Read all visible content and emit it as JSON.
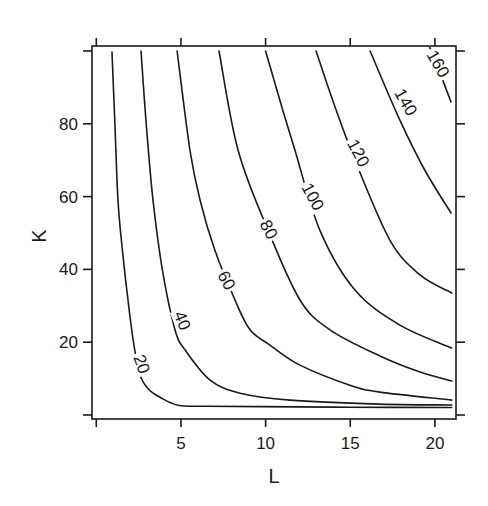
{
  "chart_data": {
    "type": "contour",
    "title": "",
    "xlabel": "L",
    "ylabel": "K",
    "xlim": [
      -0.25,
      21.25
    ],
    "ylim": [
      -1,
      101
    ],
    "x_ticks": [
      0,
      5,
      10,
      15,
      20
    ],
    "x_tick_labels": [
      "",
      "5",
      "10",
      "15",
      "20"
    ],
    "y_ticks": [
      0,
      20,
      40,
      60,
      80,
      100
    ],
    "y_tick_labels": [
      "",
      "20",
      "40",
      "60",
      "80",
      ""
    ],
    "grid": false,
    "legend": null,
    "levels": [
      20,
      40,
      60,
      80,
      100,
      120,
      140,
      160
    ],
    "contours": [
      {
        "level": 20,
        "label": "20",
        "label_pos": [
          2.7,
          14
        ],
        "label_angle": 70,
        "points": [
          [
            0.93,
            99.7
          ],
          [
            1.1,
            80
          ],
          [
            1.28,
            59
          ],
          [
            1.55,
            45
          ],
          [
            1.87,
            31.6
          ],
          [
            2.2,
            20
          ],
          [
            2.58,
            11
          ],
          [
            3.1,
            7
          ],
          [
            3.76,
            4.9
          ],
          [
            4.83,
            2.7
          ],
          [
            6.5,
            2.4
          ],
          [
            9.7,
            2.3
          ],
          [
            15,
            2.15
          ],
          [
            21,
            2.05
          ]
        ]
      },
      {
        "level": 40,
        "label": "40",
        "label_pos": [
          5.1,
          26
        ],
        "label_angle": 68,
        "points": [
          [
            2.64,
            100
          ],
          [
            2.95,
            80
          ],
          [
            3.35,
            59
          ],
          [
            3.9,
            40
          ],
          [
            4.65,
            23.4
          ],
          [
            5.24,
            17.9
          ],
          [
            6.72,
            9.6
          ],
          [
            8.49,
            6
          ],
          [
            11.44,
            4.1
          ],
          [
            16.76,
            3
          ],
          [
            21,
            2.75
          ]
        ]
      },
      {
        "level": 60,
        "label": "60",
        "label_pos": [
          7.7,
          37
        ],
        "label_angle": 62,
        "points": [
          [
            4.77,
            100
          ],
          [
            5.53,
            72.8
          ],
          [
            6.13,
            59
          ],
          [
            7.0,
            45.3
          ],
          [
            8.19,
            31.6
          ],
          [
            9.08,
            23.4
          ],
          [
            10.26,
            19.2
          ],
          [
            12.03,
            13.7
          ],
          [
            14.98,
            8.2
          ],
          [
            16.76,
            6.3
          ],
          [
            21,
            4.1
          ]
        ]
      },
      {
        "level": 80,
        "label": "80",
        "label_pos": [
          10.2,
          51
        ],
        "label_angle": 62,
        "points": [
          [
            7.25,
            100
          ],
          [
            8.37,
            72.8
          ],
          [
            10.14,
            50.8
          ],
          [
            12.03,
            31.6
          ],
          [
            13.8,
            23.4
          ],
          [
            16.76,
            16.2
          ],
          [
            19,
            12
          ],
          [
            21,
            9.3
          ]
        ]
      },
      {
        "level": 100,
        "label": "100",
        "label_pos": [
          12.8,
          60
        ],
        "label_angle": 62,
        "points": [
          [
            10.0,
            100
          ],
          [
            11.0,
            84
          ],
          [
            11.73,
            72.8
          ],
          [
            13.2,
            50.8
          ],
          [
            15.28,
            34.3
          ],
          [
            17.93,
            24.7
          ],
          [
            21,
            18.4
          ]
        ]
      },
      {
        "level": 120,
        "label": "120",
        "label_pos": [
          15.5,
          72
        ],
        "label_angle": 62,
        "points": [
          [
            12.98,
            100
          ],
          [
            14.0,
            86
          ],
          [
            15.28,
            70
          ],
          [
            17.35,
            48
          ],
          [
            19.12,
            38.5
          ],
          [
            21,
            33.5
          ]
        ]
      },
      {
        "level": 140,
        "label": "140",
        "label_pos": [
          18.3,
          86
        ],
        "label_angle": 60,
        "points": [
          [
            16.17,
            100
          ],
          [
            17.93,
            81
          ],
          [
            19.4,
            67.3
          ],
          [
            20.95,
            55.5
          ]
        ]
      },
      {
        "level": 160,
        "label": "160",
        "label_pos": [
          20.2,
          96.5
        ],
        "label_angle": 60,
        "points": [
          [
            19.7,
            101
          ],
          [
            20.3,
            94
          ],
          [
            20.95,
            86
          ]
        ]
      }
    ]
  },
  "axes": {
    "x_title": "L",
    "y_title": "K"
  }
}
